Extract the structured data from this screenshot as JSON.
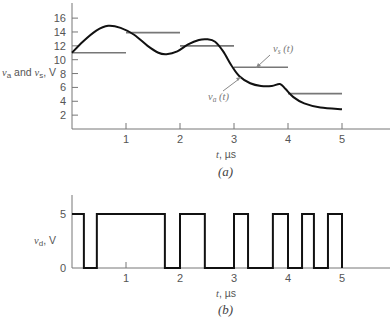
{
  "chart_data": [
    {
      "id": "a",
      "type": "line",
      "caption": "(a)",
      "xlabel": "t, µs",
      "ylabel": "v_a and v_s, V",
      "ylabel_parts": {
        "v1": "v",
        "sub1": "a",
        "mid": " and ",
        "v2": "v",
        "sub2": "s",
        "unit": ", V"
      },
      "xlabel_parts": {
        "var": "t",
        "unit": ", µs"
      },
      "xlim": [
        0,
        5.9
      ],
      "ylim": [
        0,
        18
      ],
      "grid": false,
      "x_ticks": [
        1,
        2,
        3,
        4,
        5
      ],
      "y_ticks": [
        2,
        4,
        6,
        8,
        10,
        12,
        14,
        16
      ],
      "series": [
        {
          "name": "v_s(t)",
          "label": {
            "v": "v",
            "sub": "s",
            "arg": " (t)"
          },
          "style": "step-segments",
          "color": "#777777",
          "segments": [
            {
              "t0": 0,
              "t1": 1,
              "v": 11.0
            },
            {
              "t0": 1,
              "t1": 2,
              "v": 13.9
            },
            {
              "t0": 2,
              "t1": 3,
              "v": 12.0
            },
            {
              "t0": 3,
              "t1": 4,
              "v": 8.9
            },
            {
              "t0": 4,
              "t1": 5,
              "v": 5.1
            }
          ]
        },
        {
          "name": "v_a(t)",
          "label": {
            "v": "v",
            "sub": "a",
            "arg": " (t)"
          },
          "style": "smooth",
          "color": "#111111",
          "points": [
            [
              0,
              11.0
            ],
            [
              0.2,
              12.6
            ],
            [
              0.45,
              14.2
            ],
            [
              0.67,
              14.9
            ],
            [
              0.9,
              14.6
            ],
            [
              1.15,
              13.6
            ],
            [
              1.4,
              12.0
            ],
            [
              1.6,
              11.0
            ],
            [
              1.75,
              10.8
            ],
            [
              1.95,
              11.2
            ],
            [
              2.15,
              12.2
            ],
            [
              2.35,
              12.85
            ],
            [
              2.5,
              12.95
            ],
            [
              2.65,
              12.6
            ],
            [
              2.8,
              11.2
            ],
            [
              2.95,
              9.2
            ],
            [
              3.1,
              7.6
            ],
            [
              3.3,
              6.6
            ],
            [
              3.5,
              6.2
            ],
            [
              3.7,
              6.2
            ],
            [
              3.85,
              6.5
            ],
            [
              3.95,
              5.8
            ],
            [
              4.1,
              4.6
            ],
            [
              4.3,
              3.7
            ],
            [
              4.6,
              3.1
            ],
            [
              5.0,
              2.85
            ]
          ]
        }
      ]
    },
    {
      "id": "b",
      "type": "line",
      "caption": "(b)",
      "xlabel": "t, µs",
      "ylabel": "v_d, V",
      "ylabel_parts": {
        "v": "v",
        "sub": "d",
        "unit": ", V"
      },
      "xlabel_parts": {
        "var": "t",
        "unit": ", µs"
      },
      "xlim": [
        0,
        5.9
      ],
      "ylim": [
        0,
        6
      ],
      "grid": false,
      "x_ticks": [
        1,
        2,
        3,
        4,
        5
      ],
      "y_ticks": [
        0,
        5
      ],
      "series": [
        {
          "name": "v_d(t)",
          "style": "digital-step",
          "color": "#111111",
          "transitions": [
            {
              "t": 0.0,
              "v": 5
            },
            {
              "t": 0.22,
              "v": 0
            },
            {
              "t": 0.46,
              "v": 5
            },
            {
              "t": 1.72,
              "v": 0
            },
            {
              "t": 2.0,
              "v": 5
            },
            {
              "t": 2.46,
              "v": 0
            },
            {
              "t": 3.0,
              "v": 5
            },
            {
              "t": 3.26,
              "v": 0
            },
            {
              "t": 3.72,
              "v": 5
            },
            {
              "t": 4.0,
              "v": 0
            },
            {
              "t": 4.26,
              "v": 5
            },
            {
              "t": 4.48,
              "v": 0
            },
            {
              "t": 4.74,
              "v": 5
            },
            {
              "t": 5.0,
              "v": 0
            }
          ]
        }
      ]
    }
  ],
  "layout": {
    "top": {
      "x0": 72,
      "x_per_unit": 54,
      "y0": 129,
      "y_per_unit": 6.93,
      "axis_top": 3,
      "axis_right": 390
    },
    "bottom": {
      "x0": 72,
      "x_per_unit": 54,
      "y0": 268,
      "y_per_unit": 10.8,
      "axis_top": 195,
      "axis_right": 390
    }
  }
}
